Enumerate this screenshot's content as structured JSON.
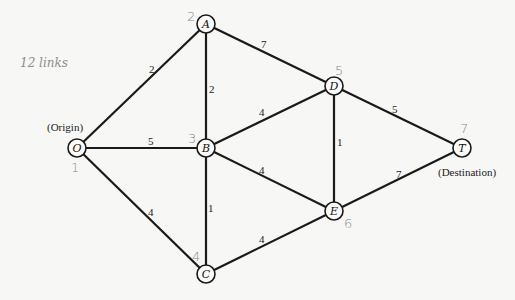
{
  "note": "12 links",
  "captions": {
    "origin": "(Origin)",
    "destination": "(Destination)"
  },
  "nodes": [
    {
      "id": "O",
      "label": "O",
      "number": "1",
      "x": 77,
      "y": 148
    },
    {
      "id": "A",
      "label": "A",
      "number": "2",
      "x": 206,
      "y": 24
    },
    {
      "id": "B",
      "label": "B",
      "number": "3",
      "x": 206,
      "y": 148
    },
    {
      "id": "C",
      "label": "C",
      "number": "4",
      "x": 206,
      "y": 274
    },
    {
      "id": "D",
      "label": "D",
      "number": "5",
      "x": 334,
      "y": 86
    },
    {
      "id": "E",
      "label": "E",
      "number": "6",
      "x": 334,
      "y": 211
    },
    {
      "id": "T",
      "label": "T",
      "number": "7",
      "x": 462,
      "y": 148
    }
  ],
  "edges": [
    {
      "from": "O",
      "to": "A",
      "weight": "2"
    },
    {
      "from": "O",
      "to": "B",
      "weight": "5"
    },
    {
      "from": "O",
      "to": "C",
      "weight": "4"
    },
    {
      "from": "A",
      "to": "B",
      "weight": "2"
    },
    {
      "from": "A",
      "to": "D",
      "weight": "7"
    },
    {
      "from": "B",
      "to": "C",
      "weight": "1"
    },
    {
      "from": "B",
      "to": "D",
      "weight": "4"
    },
    {
      "from": "B",
      "to": "E",
      "weight": "4"
    },
    {
      "from": "C",
      "to": "E",
      "weight": "4"
    },
    {
      "from": "D",
      "to": "E",
      "weight": "1"
    },
    {
      "from": "D",
      "to": "T",
      "weight": "5"
    },
    {
      "from": "E",
      "to": "T",
      "weight": "7"
    }
  ]
}
